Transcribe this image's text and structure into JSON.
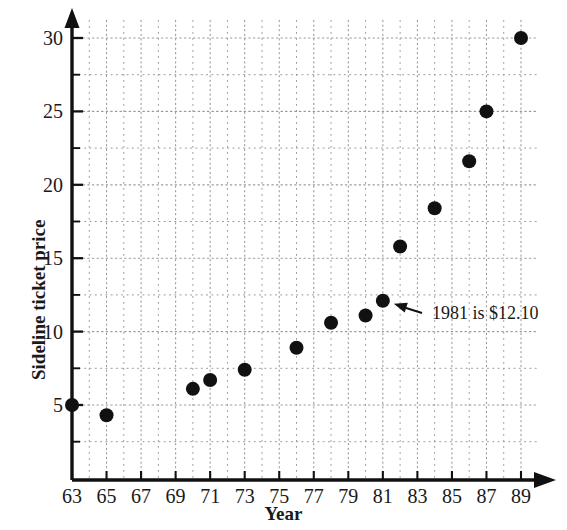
{
  "chart_data": {
    "type": "scatter",
    "title": "",
    "xlabel": "Year",
    "ylabel": "Sideline ticket price",
    "xlim": [
      62,
      90
    ],
    "ylim": [
      0,
      31.5
    ],
    "grid": true,
    "legend": null,
    "xticks": [
      "63",
      "65",
      "67",
      "69",
      "71",
      "73",
      "75",
      "77",
      "79",
      "81",
      "83",
      "85",
      "87",
      "89"
    ],
    "xtick_values": [
      63,
      65,
      67,
      69,
      71,
      73,
      75,
      77,
      79,
      81,
      83,
      85,
      87,
      89
    ],
    "yticks": [
      "5",
      "10",
      "15",
      "20",
      "25",
      "30"
    ],
    "ytick_values": [
      5,
      10,
      15,
      20,
      25,
      30
    ],
    "minor_y_gridlines": [
      2.5,
      7.5,
      12.5,
      17.5,
      22.5,
      27.5
    ],
    "minor_x_gridlines": [
      64,
      66,
      68,
      70,
      72,
      74,
      76,
      78,
      80,
      82,
      84,
      86,
      88
    ],
    "x": [
      63,
      65,
      70,
      71,
      73,
      76,
      78,
      80,
      81,
      82,
      84,
      86,
      87,
      89
    ],
    "y": [
      5.0,
      4.3,
      6.1,
      6.7,
      7.4,
      8.9,
      10.6,
      11.1,
      12.1,
      15.8,
      18.4,
      21.6,
      25.0,
      30.0
    ],
    "points": [
      {
        "year": 63,
        "price": 5.0
      },
      {
        "year": 65,
        "price": 4.3
      },
      {
        "year": 70,
        "price": 6.1
      },
      {
        "year": 71,
        "price": 6.7
      },
      {
        "year": 73,
        "price": 7.4
      },
      {
        "year": 76,
        "price": 8.9
      },
      {
        "year": 78,
        "price": 10.6
      },
      {
        "year": 80,
        "price": 11.1
      },
      {
        "year": 81,
        "price": 12.1
      },
      {
        "year": 82,
        "price": 15.8
      },
      {
        "year": 84,
        "price": 18.4
      },
      {
        "year": 86,
        "price": 21.6
      },
      {
        "year": 87,
        "price": 25.0
      },
      {
        "year": 89,
        "price": 30.0
      }
    ],
    "annotations": [
      {
        "text": "1981 is $12.10",
        "target_year": 81,
        "target_price": 12.1,
        "text_x": 432,
        "text_y": 319
      }
    ],
    "colors": {
      "marker": "#111111",
      "axis": "#111111",
      "grid": "#9a9a9a",
      "background": "#ffffff",
      "text": "#1a1a1a"
    },
    "marker_radius": 7
  }
}
